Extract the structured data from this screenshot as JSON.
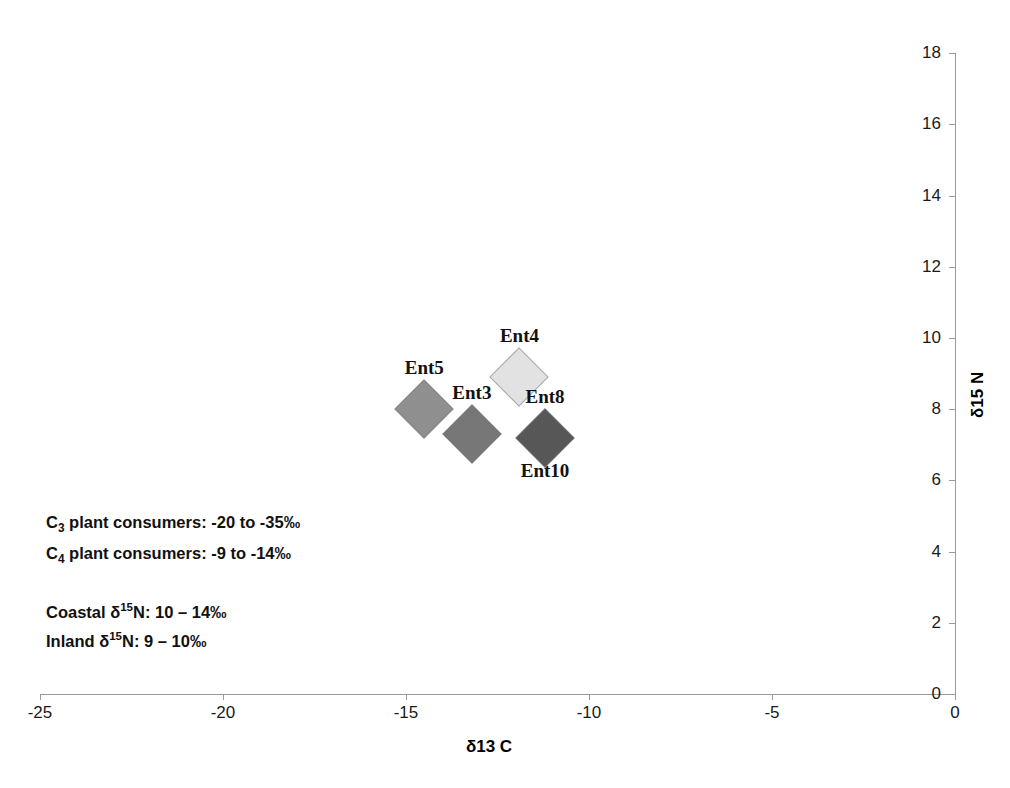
{
  "chart_data": {
    "type": "scatter",
    "title": "",
    "xlabel": "δ13 C",
    "ylabel": "δ15 N",
    "xlim": [
      -25,
      0
    ],
    "ylim": [
      0,
      18
    ],
    "xticks": [
      -25,
      -20,
      -15,
      -10,
      -5,
      0
    ],
    "xtick_labels": [
      "-25",
      "-20",
      "-15",
      "-10",
      "-5",
      "0"
    ],
    "yticks": [
      0,
      2,
      4,
      6,
      8,
      10,
      12,
      14,
      16,
      18
    ],
    "ytick_labels": [
      "0",
      "2",
      "4",
      "6",
      "8",
      "10",
      "12",
      "14",
      "16",
      "18"
    ],
    "grid": false,
    "legend": false,
    "marker_shape": "diamond",
    "points": [
      {
        "name": "Ent5",
        "x": -14.5,
        "y": 8.0,
        "color": "#8f8f8f",
        "label": "Ent5",
        "label_pos": "above"
      },
      {
        "name": "Ent4",
        "x": -11.9,
        "y": 8.9,
        "color": "#e2e2e2",
        "label": "Ent4",
        "label_pos": "above"
      },
      {
        "name": "Ent3",
        "x": -13.2,
        "y": 7.3,
        "color": "#777777",
        "label": "Ent3",
        "label_pos": "above"
      },
      {
        "name": "Ent8",
        "x": -11.2,
        "y": 7.2,
        "color": "#575757",
        "label": "Ent8",
        "label_pos": "above"
      },
      {
        "name": "Ent10",
        "x": -11.2,
        "y": 7.2,
        "color": "#575757",
        "label": "Ent10",
        "label_pos": "below"
      }
    ],
    "annotations": [
      "C3 plant consumers: -20 to -35‰",
      "C4 plant consumers:  -9 to -14‰",
      "Coastal δ15N: 10 – 14‰",
      "Inland δ15N: 9 – 10‰"
    ]
  },
  "axis": {
    "x_title": "δ13 C",
    "y_title": "δ15 N"
  },
  "annotations": {
    "c3_prefix": "C",
    "c3_sub": "3",
    "c3_rest": " plant consumers: -20 to -35‰",
    "c4_prefix": "C",
    "c4_sub": "4",
    "c4_rest": " plant consumers:  -9 to -14‰",
    "coastal_prefix": "Coastal δ",
    "coastal_sup": "15",
    "coastal_rest": "N: 10 – 14‰",
    "inland_prefix": "Inland δ",
    "inland_sup": "15",
    "inland_rest": "N: 9 – 10‰"
  }
}
